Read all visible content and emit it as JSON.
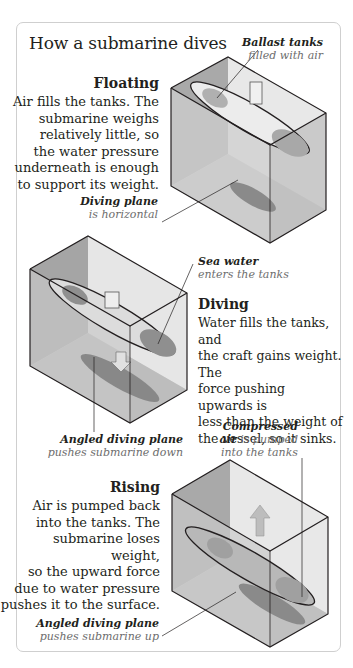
{
  "title": "How a submarine dives",
  "sections": [
    {
      "heading": "Floating",
      "body": [
        "Air fills the tanks. The",
        "submarine weighs",
        "relatively little, so",
        "the water pressure",
        "underneath is enough",
        "to support its weight."
      ]
    },
    {
      "heading": "Diving",
      "body": [
        "Water fills the tanks, and",
        "the craft gains weight. The",
        "force pushing upwards is",
        "less than the weight of",
        "the vessel, so it sinks."
      ]
    },
    {
      "heading": "Rising",
      "body": [
        "Air is pumped back",
        "into the tanks. The",
        "submarine loses weight,",
        "so the upward force",
        "due to water pressure",
        "pushes it to the surface."
      ]
    }
  ],
  "labels": {
    "ballast": {
      "bold": "Ballast tanks",
      "note": "filled with air"
    },
    "diving_plane": {
      "bold": "Diving plane",
      "note": "is horizontal"
    },
    "sea_water": {
      "bold": "Sea water",
      "note": "enters the tanks"
    },
    "angled_down": {
      "bold": "Angled diving plane",
      "note": "pushes submarine down"
    },
    "compressed": {
      "bold1": "Compressed",
      "bold2": "air",
      "note1": "is pumped",
      "note2": "into the tanks"
    },
    "angled_up": {
      "bold": "Angled diving plane",
      "note": "pushes submarine up"
    }
  },
  "colors": {
    "box_dark": "#a9a9a9",
    "box_light": "#e6e6e6",
    "sub": "#bdbdbd",
    "shadow": "#8a8a8a",
    "arrow": "#b5b5b5"
  }
}
